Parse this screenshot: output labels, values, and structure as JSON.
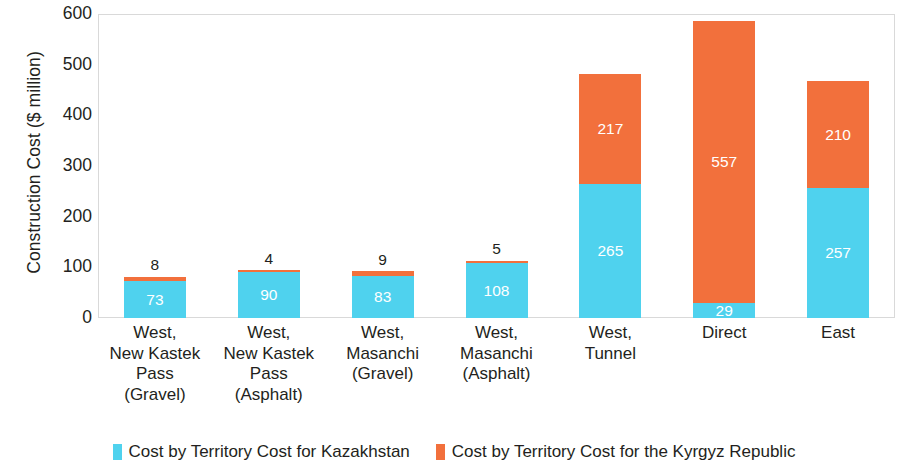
{
  "chart_data": {
    "type": "bar",
    "subtype": "stacked-bar",
    "title": "",
    "xlabel": "",
    "ylabel": "Construction Cost ($ million)",
    "ylim": [
      0,
      600
    ],
    "ytick_step": 100,
    "yticks": [
      "600",
      "500",
      "400",
      "300",
      "200",
      "100",
      "0"
    ],
    "grid": false,
    "legend_position": "bottom",
    "categories": [
      "West,\nNew Kastek\nPass\n(Gravel)",
      "West,\nNew Kastek\nPass\n(Asphalt)",
      "West,\nMasanchi\n(Gravel)",
      "West,\nMasanchi\n(Asphalt)",
      "West,\nTunnel",
      "Direct",
      "East"
    ],
    "category_lines": [
      [
        "West,",
        "New Kastek",
        "Pass",
        "(Gravel)"
      ],
      [
        "West,",
        "New Kastek",
        "Pass",
        "(Asphalt)"
      ],
      [
        "West,",
        "Masanchi",
        "(Gravel)"
      ],
      [
        "West,",
        "Masanchi",
        "(Asphalt)"
      ],
      [
        "West,",
        "Tunnel"
      ],
      [
        "Direct"
      ],
      [
        "East"
      ]
    ],
    "series": [
      {
        "name": "Cost by Territory Cost for Kazakhstan",
        "color": "#4FD2EE",
        "values": [
          73,
          90,
          83,
          108,
          265,
          29,
          257
        ]
      },
      {
        "name": "Cost by Territory Cost for the Kyrgyz Republic",
        "color": "#F2703C",
        "values": [
          8,
          4,
          9,
          5,
          217,
          557,
          210
        ]
      }
    ],
    "totals": [
      81,
      94,
      92,
      113,
      482,
      586,
      467
    ]
  },
  "legend": {
    "items": [
      {
        "label": "Cost by Territory Cost for Kazakhstan",
        "color": "#4FD2EE"
      },
      {
        "label": "Cost by Territory Cost for the Kyrgyz Republic",
        "color": "#F2703C"
      }
    ]
  },
  "colors": {
    "kazakhstan": "#4FD2EE",
    "kyrgyz": "#F2703C",
    "axis_text": "#231f20",
    "frame": "#d9d9d9",
    "background": "#ffffff"
  }
}
